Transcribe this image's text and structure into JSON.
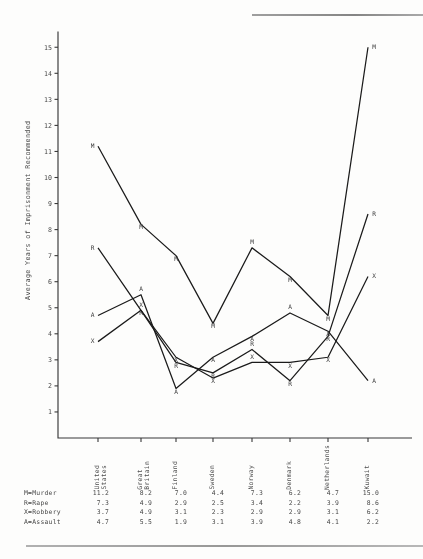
{
  "chart_data": {
    "type": "line",
    "title": "",
    "xlabel": "",
    "ylabel": "Average Years of Imprisonment Recommended",
    "ylim": [
      0,
      15.6
    ],
    "yticks": [
      1,
      2,
      3,
      4,
      5,
      6,
      7,
      8,
      9,
      10,
      11,
      12,
      13,
      14,
      15
    ],
    "grid": false,
    "legend_position": "below-table",
    "point_labels": true,
    "categories": [
      "United States",
      "Great Britain",
      "Finland",
      "Sweden",
      "Norway",
      "Denmark",
      "Netherlands",
      "Kuwait"
    ],
    "series": [
      {
        "name": "Murder",
        "marker": "M",
        "values": [
          11.2,
          8.2,
          7.0,
          4.4,
          7.3,
          6.2,
          4.7,
          15.0
        ]
      },
      {
        "name": "Rape",
        "marker": "R",
        "values": [
          7.3,
          4.9,
          2.9,
          2.5,
          3.4,
          2.2,
          3.9,
          8.6
        ]
      },
      {
        "name": "Robbery",
        "marker": "X",
        "values": [
          3.7,
          4.9,
          3.1,
          2.3,
          2.9,
          2.9,
          3.1,
          6.2
        ]
      },
      {
        "name": "Assault",
        "marker": "A",
        "values": [
          4.7,
          5.5,
          1.9,
          3.1,
          3.9,
          4.8,
          4.1,
          2.2
        ]
      }
    ]
  },
  "axis": {
    "y_title": "Average Years of Imprisonment Recommended",
    "y_tick_labels": [
      "15",
      "14",
      "13",
      "12",
      "11",
      "10",
      "9",
      "8",
      "7",
      "6",
      "5",
      "4",
      "3",
      "2",
      "1"
    ]
  },
  "categories_display": [
    "United\nStates",
    "Great\nBritain",
    "Finland",
    "Sweden",
    "Norway",
    "Denmark",
    "Netherlands",
    "Kuwait"
  ],
  "table": {
    "row_labels": [
      "M=Murder",
      "R=Rape",
      "X=Robbery",
      "A=Assault"
    ],
    "rows": [
      {
        "label": "M=Murder",
        "values": [
          "11.2",
          "8.2",
          "7.0",
          "4.4",
          "7.3",
          "6.2",
          "4.7",
          "15.0"
        ]
      },
      {
        "label": "R=Rape",
        "values": [
          "7.3",
          "4.9",
          "2.9",
          "2.5",
          "3.4",
          "2.2",
          "3.9",
          "8.6"
        ]
      },
      {
        "label": "X=Robbery",
        "values": [
          "3.7",
          "4.9",
          "3.1",
          "2.3",
          "2.9",
          "2.9",
          "3.1",
          "6.2"
        ]
      },
      {
        "label": "A=Assault",
        "values": [
          "4.7",
          "5.5",
          "1.9",
          "3.1",
          "3.9",
          "4.8",
          "4.1",
          "2.2"
        ]
      }
    ]
  },
  "colors": {
    "ink": "#1d1d1d",
    "axis": "#3a3a3a",
    "text": "#4a4a4a",
    "paper": "#fdfdfc"
  }
}
